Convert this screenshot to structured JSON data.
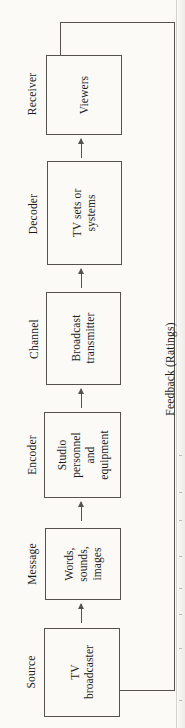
{
  "diagram": {
    "orientation": "rotated-90-ccw",
    "stages": [
      {
        "id": "source",
        "caption": "Source",
        "box_text": "TV\nbroadcaster",
        "box_lines": [
          "TV",
          "broadcaster"
        ]
      },
      {
        "id": "message",
        "caption": "Message",
        "box_text": "Words,\nsounds,\nimages",
        "box_lines": [
          "Words,",
          "sounds,",
          "images"
        ]
      },
      {
        "id": "encoder",
        "caption": "Encoder",
        "box_text": "Studio\npersonnel\nand\nequipment",
        "box_lines": [
          "Studio",
          "personnel",
          "and",
          "equipment"
        ]
      },
      {
        "id": "channel",
        "caption": "Channel",
        "box_text": "Broadcast\ntransmitter",
        "box_lines": [
          "Broadcast",
          "transmitter"
        ]
      },
      {
        "id": "decoder",
        "caption": "Decoder",
        "box_text": "TV sets or\nsystems",
        "box_lines": [
          "TV sets or",
          "systems"
        ]
      },
      {
        "id": "receiver",
        "caption": "Receiver",
        "box_text": "Viewers",
        "box_lines": [
          "Viewers"
        ]
      }
    ],
    "feedback": {
      "label": "Feedback (Ratings)",
      "from": "receiver",
      "to": "source"
    },
    "colors": {
      "paper": "#fbfaf7",
      "ink": "#1a1a1a",
      "rule": "#555250"
    }
  }
}
